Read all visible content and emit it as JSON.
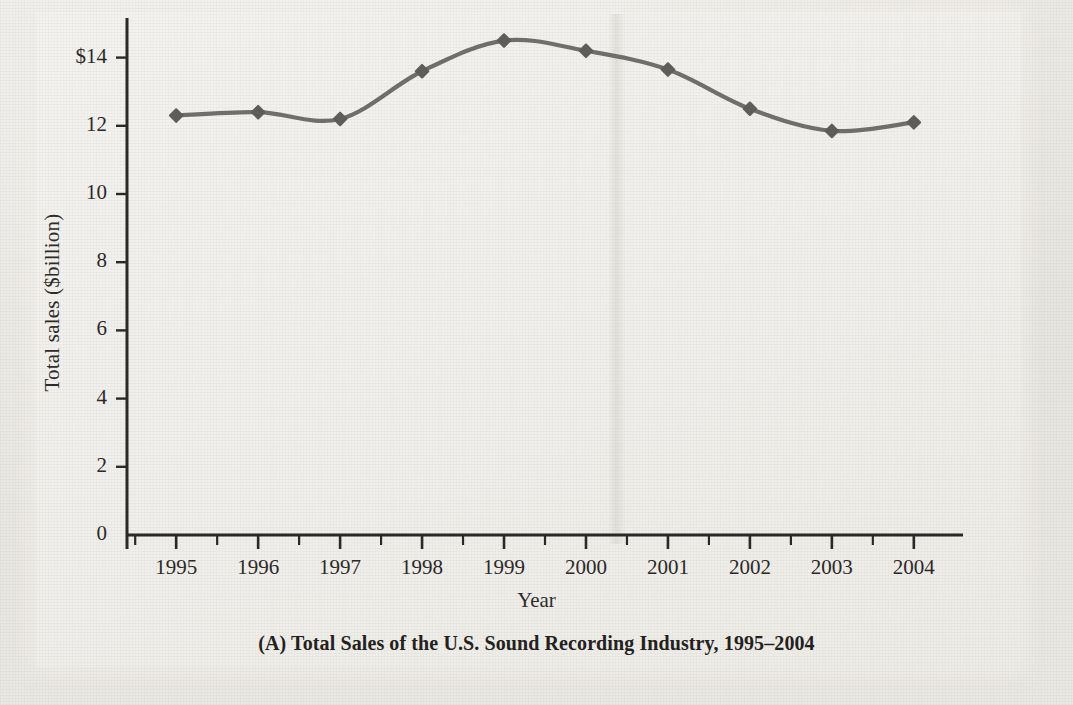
{
  "figure": {
    "caption": "(A) Total Sales of the U.S. Sound Recording Industry, 1995–2004",
    "panel_letter": "(A)"
  },
  "axes": {
    "x_title": "Year",
    "y_title": "Total sales ($billion)",
    "y_ticks": [
      "$14",
      "12",
      "10",
      "8",
      "6",
      "4",
      "2",
      "0"
    ],
    "x_ticks": [
      "1995",
      "1996",
      "1997",
      "1998",
      "1999",
      "2000",
      "2001",
      "2002",
      "2003",
      "2004"
    ]
  },
  "style": {
    "line_color": "#6f6e6b",
    "marker_color": "#5e5d5a",
    "axis_color": "#2b2928",
    "paper_color": "#eceae5",
    "plate_color": "#f2f0ec"
  },
  "chart_data": {
    "type": "line",
    "title": "(A) Total Sales of the U.S. Sound Recording Industry, 1995–2004",
    "xlabel": "Year",
    "ylabel": "Total sales ($billion)",
    "categories": [
      "1995",
      "1996",
      "1997",
      "1998",
      "1999",
      "2000",
      "2001",
      "2002",
      "2003",
      "2004"
    ],
    "x": [
      1995,
      1996,
      1997,
      1998,
      1999,
      2000,
      2001,
      2002,
      2003,
      2004
    ],
    "values": [
      12.3,
      12.4,
      12.2,
      13.6,
      14.5,
      14.2,
      13.65,
      12.5,
      11.85,
      12.1
    ],
    "series": [
      {
        "name": "Total sales ($billion)",
        "values": [
          12.3,
          12.4,
          12.2,
          13.6,
          14.5,
          14.2,
          13.65,
          12.5,
          11.85,
          12.1
        ]
      }
    ],
    "ylim": [
      0,
      15
    ],
    "xlim": [
      1994.4,
      2004.6
    ],
    "y_tick_values": [
      0,
      2,
      4,
      6,
      8,
      10,
      12,
      14
    ],
    "grid": false,
    "legend": "none",
    "marker": "diamond",
    "interpolation": "smooth"
  }
}
